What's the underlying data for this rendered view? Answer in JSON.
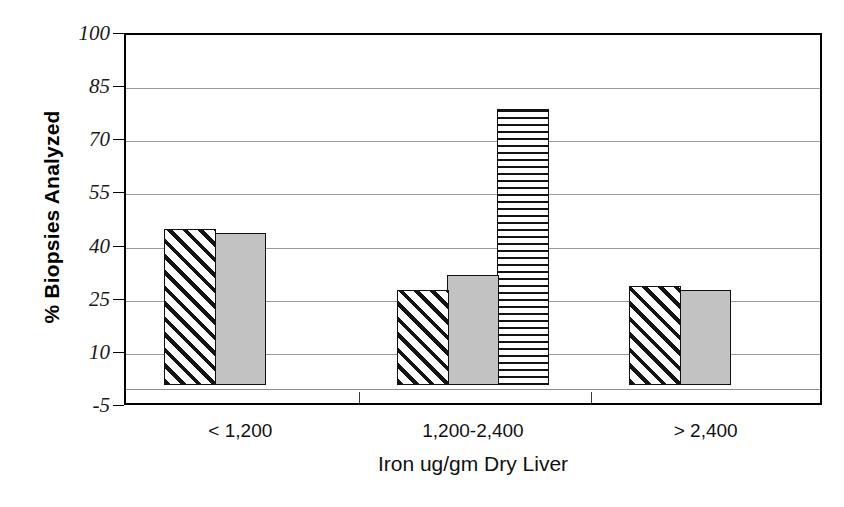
{
  "chart_data": {
    "type": "bar",
    "title": "",
    "xlabel": "Iron ug/gm Dry Liver",
    "ylabel": "% Biopsies Analyzed",
    "categories": [
      "< 1,200",
      "1,200-2,400",
      "> 2,400"
    ],
    "series": [
      {
        "name": "series-1",
        "pattern": "diagonal-hatch",
        "values": [
          44,
          27,
          28
        ]
      },
      {
        "name": "series-2",
        "pattern": "solid-gray",
        "values": [
          43,
          31,
          27
        ]
      },
      {
        "name": "series-3",
        "pattern": "horizontal-stripe",
        "values": [
          null,
          78,
          null
        ]
      }
    ],
    "ylim": [
      -5,
      100
    ],
    "yticks": [
      "100",
      "85",
      "70",
      "55",
      "40",
      "25",
      "10",
      "-5"
    ],
    "ytick_values": [
      100,
      85,
      70,
      55,
      40,
      25,
      10,
      -5
    ],
    "grid": true,
    "legend": "none",
    "baseline_value": 0,
    "colors": {
      "gray_fill": "#c2c2c2",
      "hatch_ink": "#141414",
      "gridline": "#9a9a9a",
      "frame": "#000000",
      "background": "#ffffff"
    }
  },
  "axes": {
    "y_title": "% Biopsies Analyzed",
    "x_title": "Iron ug/gm Dry Liver",
    "y_ticks": [
      {
        "label": "100",
        "value": 100
      },
      {
        "label": "85",
        "value": 85
      },
      {
        "label": "70",
        "value": 70
      },
      {
        "label": "55",
        "value": 55
      },
      {
        "label": "40",
        "value": 40
      },
      {
        "label": "25",
        "value": 25
      },
      {
        "label": "10",
        "value": 10
      },
      {
        "label": "-5",
        "value": -5
      }
    ],
    "x_ticks": [
      {
        "label": "< 1,200"
      },
      {
        "label": "1,200-2,400"
      },
      {
        "label": "> 2,400"
      }
    ]
  },
  "bars": [
    {
      "group": "< 1,200",
      "series": "series-1",
      "pattern": "diagonal-hatch",
      "value": 44
    },
    {
      "group": "< 1,200",
      "series": "series-2",
      "pattern": "solid-gray",
      "value": 43
    },
    {
      "group": "1,200-2,400",
      "series": "series-1",
      "pattern": "diagonal-hatch",
      "value": 27
    },
    {
      "group": "1,200-2,400",
      "series": "series-2",
      "pattern": "solid-gray",
      "value": 31
    },
    {
      "group": "1,200-2,400",
      "series": "series-3",
      "pattern": "horizontal-stripe",
      "value": 78
    },
    {
      "group": "> 2,400",
      "series": "series-1",
      "pattern": "diagonal-hatch",
      "value": 28
    },
    {
      "group": "> 2,400",
      "series": "series-2",
      "pattern": "solid-gray",
      "value": 27
    }
  ]
}
